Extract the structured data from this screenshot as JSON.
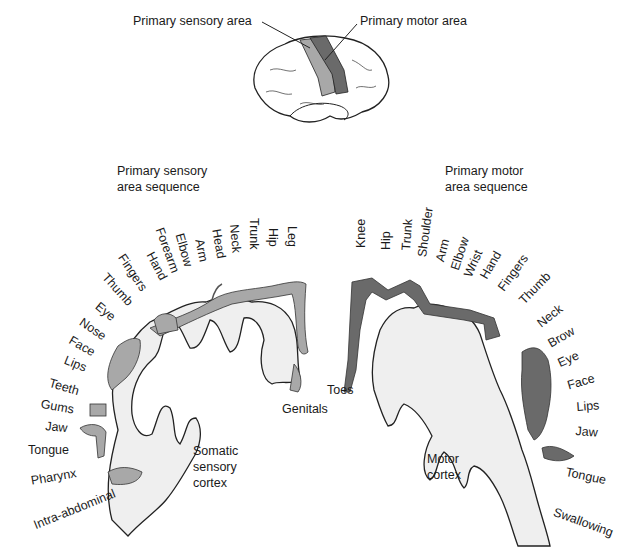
{
  "overview": {
    "sensory_label": "Primary sensory area",
    "motor_label": "Primary motor area",
    "colors": {
      "sensory": "#a8a8a8",
      "motor": "#6a6a6a",
      "cortex": "#efefef",
      "outline": "#222222"
    }
  },
  "sensory": {
    "title_line1": "Primary sensory",
    "title_line2": "area sequence",
    "cortex_label_1": "Somatic",
    "cortex_label_2": "sensory",
    "cortex_label_3": "cortex",
    "genitals": "Genitals",
    "parts": [
      "Leg",
      "Hip",
      "Trunk",
      "Neck",
      "Head",
      "Arm",
      "Elbow",
      "Forearm",
      "Hand",
      "Fingers",
      "Thumb",
      "Eye",
      "Nose",
      "Face",
      "Lips",
      "Teeth",
      "Gums",
      "Jaw",
      "Tongue",
      "Pharynx",
      "Intra-abdominal"
    ]
  },
  "motor": {
    "title_line1": "Primary motor",
    "title_line2": "area sequence",
    "cortex_label_1": "Motor",
    "cortex_label_2": "cortex",
    "toes": "Toes",
    "parts": [
      "Knee",
      "Hip",
      "Trunk",
      "Shoulder",
      "Arm",
      "Elbow",
      "Wrist",
      "Hand",
      "Fingers",
      "Thumb",
      "Neck",
      "Brow",
      "Eye",
      "Face",
      "Lips",
      "Jaw",
      "Tongue",
      "Swallowing"
    ]
  }
}
